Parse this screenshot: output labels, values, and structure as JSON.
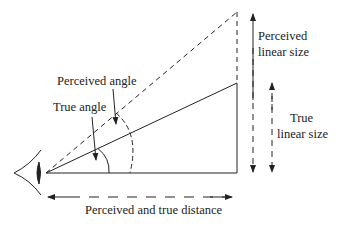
{
  "diagram": {
    "labels": {
      "perceived_angle": "Perceived angle",
      "true_angle": "True angle",
      "perceived_size_line1": "Perceived",
      "perceived_size_line2": "linear size",
      "true_size_line1": "True",
      "true_size_line2": "linear size",
      "distance": "Perceived and true distance"
    },
    "icons": {
      "eye": "eye-icon"
    },
    "colors": {
      "stroke": "#222222",
      "background": "#ffffff"
    }
  }
}
